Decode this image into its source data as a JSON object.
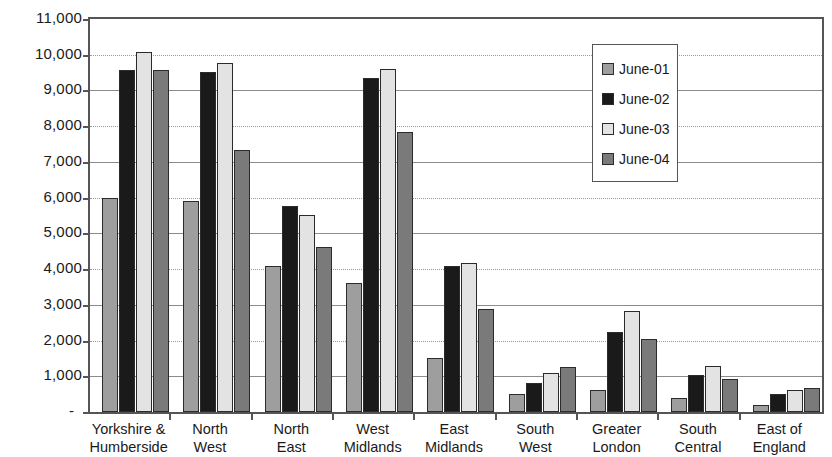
{
  "chart_data": {
    "type": "bar",
    "title": "",
    "xlabel": "",
    "ylabel": "",
    "ylim": [
      0,
      11000
    ],
    "grid": true,
    "legend_position": "inside-top-right",
    "categories": [
      "Yorkshire & Humberside",
      "North West",
      "North East",
      "West Midlands",
      "East Midlands",
      "South West",
      "Greater London",
      "South Central",
      "East of England"
    ],
    "category_lines": [
      [
        "Yorkshire &",
        "Humberside"
      ],
      [
        "North",
        "West"
      ],
      [
        "North",
        "East"
      ],
      [
        "West",
        "Midlands"
      ],
      [
        "East",
        "Midlands"
      ],
      [
        "South",
        "West"
      ],
      [
        "Greater",
        "London"
      ],
      [
        "South",
        "Central"
      ],
      [
        "East of",
        "England"
      ]
    ],
    "series": [
      {
        "name": "June-01",
        "color": "#9e9e9e",
        "values": [
          6000,
          5900,
          4100,
          3620,
          1520,
          500,
          620,
          400,
          210
        ]
      },
      {
        "name": "June-02",
        "color": "#1a1a1a",
        "values": [
          9580,
          9520,
          5780,
          9340,
          4090,
          810,
          2230,
          1030,
          510
        ]
      },
      {
        "name": "June-03",
        "color": "#e3e3e3",
        "values": [
          10080,
          9780,
          5520,
          9600,
          4180,
          1080,
          2840,
          1290,
          610
        ]
      },
      {
        "name": "June-04",
        "color": "#7a7a7a",
        "values": [
          9570,
          7330,
          4620,
          7850,
          2870,
          1270,
          2040,
          930,
          680
        ]
      }
    ],
    "y_ticks": [
      {
        "value": 11000,
        "label": "11,000"
      },
      {
        "value": 10000,
        "label": "10,000"
      },
      {
        "value": 9000,
        "label": "9,000"
      },
      {
        "value": 8000,
        "label": "8,000"
      },
      {
        "value": 7000,
        "label": "7,000"
      },
      {
        "value": 6000,
        "label": "6,000"
      },
      {
        "value": 5000,
        "label": "5,000"
      },
      {
        "value": 4000,
        "label": "4,000"
      },
      {
        "value": 3000,
        "label": "3,000"
      },
      {
        "value": 2000,
        "label": "2,000"
      },
      {
        "value": 1000,
        "label": "1,000"
      },
      {
        "value": 0,
        "label": "-"
      }
    ]
  },
  "legend": {
    "items": [
      {
        "label": "June-01"
      },
      {
        "label": "June-02"
      },
      {
        "label": "June-03"
      },
      {
        "label": "June-04"
      }
    ]
  }
}
